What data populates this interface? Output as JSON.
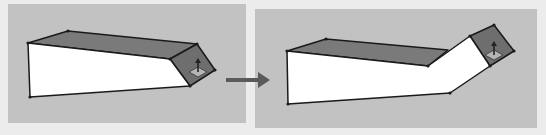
{
  "figure": {
    "panels": [
      {
        "id": "before",
        "label": "Before push/pull",
        "tool_icon": "push-pull-icon"
      },
      {
        "id": "after",
        "label": "After push/pull",
        "tool_icon": "push-pull-icon"
      }
    ],
    "transition_arrow": "right-arrow-icon"
  },
  "colors": {
    "page_background": "#ececec",
    "panel_background": "#c2c2c2",
    "front_face": "#ffffff",
    "top_face": "#7a7a7a",
    "end_face": "#6e6e6e",
    "edge": "#1a1a1a",
    "arrow": "#5a5a5a",
    "tool_icon_fill": "#b4b4b4"
  }
}
